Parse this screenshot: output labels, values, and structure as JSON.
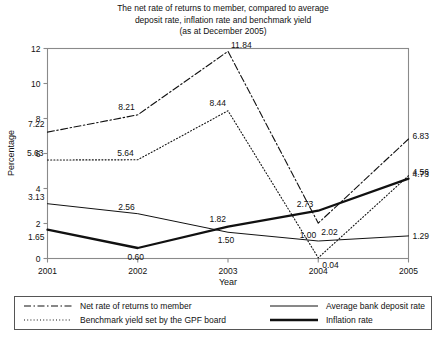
{
  "chart_data": {
    "type": "line",
    "title": "The net rate of returns to member, compared to average deposit rate, inflation rate and benchmark yield (as at December 2005)",
    "title_lines": [
      "The net rate of returns to member, compared to average",
      "deposit rate, inflation rate and benchmark yield",
      "(as at December 2005)"
    ],
    "xlabel": "Year",
    "ylabel": "Percentage",
    "categories": [
      "2001",
      "2002",
      "2003",
      "2004",
      "2005"
    ],
    "x": [
      2001,
      2002,
      2003,
      2004,
      2005
    ],
    "ylim": [
      0,
      12
    ],
    "yticks": [
      "0",
      "2",
      "4",
      "6",
      "8",
      "10",
      "12"
    ],
    "ytick_values": [
      0,
      2,
      4,
      6,
      8,
      10,
      12
    ],
    "grid": false,
    "legend_position": "bottom",
    "series": [
      {
        "name": "Net rate of returns to member",
        "style": "dash-dot",
        "values": [
          7.22,
          8.21,
          11.84,
          2.02,
          6.83
        ],
        "labels": [
          "7.22",
          "8.21",
          "11.84",
          "2.02",
          "6.83"
        ]
      },
      {
        "name": "Benchmark yield set by the GPF board",
        "style": "dotted",
        "values": [
          5.63,
          5.64,
          8.44,
          0.04,
          4.73
        ],
        "labels": [
          "5.63",
          "5.64",
          "8.44",
          "0.04",
          "4.73"
        ]
      },
      {
        "name": "Average bank deposit rate",
        "style": "thin-solid",
        "values": [
          3.13,
          2.56,
          1.5,
          1.0,
          1.29
        ],
        "labels": [
          "3.13",
          "2.56",
          "1.50",
          "1.00",
          "1.29"
        ]
      },
      {
        "name": "Inflation rate",
        "style": "thick-solid",
        "values": [
          1.65,
          0.6,
          1.82,
          2.73,
          4.56
        ],
        "labels": [
          "1.65",
          "0.60",
          "1.82",
          "2.73",
          "4.56"
        ]
      }
    ]
  },
  "legend": {
    "entries": [
      {
        "label": "Net rate of returns to member",
        "style": "dash-dot"
      },
      {
        "label": "Average bank deposit rate",
        "style": "thin-solid"
      },
      {
        "label": "Benchmark yield set by the GPF board",
        "style": "dotted"
      },
      {
        "label": "Inflation rate",
        "style": "thick-solid"
      }
    ]
  }
}
